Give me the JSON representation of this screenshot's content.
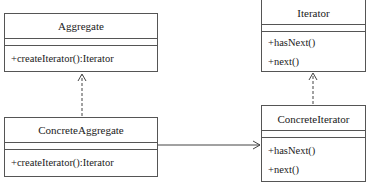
{
  "diagram": {
    "type": "UML class diagram",
    "classes": [
      {
        "id": "aggregate",
        "name": "Aggregate",
        "operations": [
          "+createIterator():Iterator"
        ]
      },
      {
        "id": "iterator",
        "name": "Iterator",
        "operations": [
          "+hasNext()",
          "+next()"
        ]
      },
      {
        "id": "concrete_aggregate",
        "name": "ConcreteAggregate",
        "operations": [
          "+createIterator():Iterator"
        ]
      },
      {
        "id": "concrete_iterator",
        "name": "ConcreteIterator",
        "operations": [
          "+hasNext()",
          "+next()"
        ]
      }
    ],
    "relations": [
      {
        "from": "ConcreteAggregate",
        "to": "Aggregate",
        "kind": "realization (dashed, open arrow)"
      },
      {
        "from": "ConcreteIterator",
        "to": "Iterator",
        "kind": "realization (dashed, open arrow)"
      },
      {
        "from": "ConcreteAggregate",
        "to": "ConcreteIterator",
        "kind": "association (solid, open arrow)"
      }
    ]
  }
}
